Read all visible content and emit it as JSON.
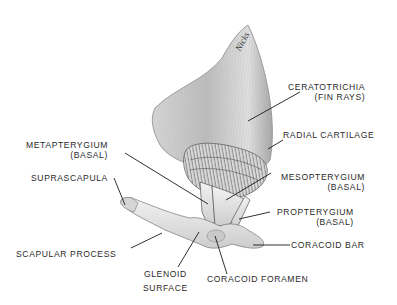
{
  "diagram": {
    "signature": "Nicks",
    "labels": [
      {
        "id": "ceratotrichia",
        "line1": "CERATOTRICHIA",
        "line2": "(FIN RAYS)"
      },
      {
        "id": "radial-cartilage",
        "line1": "RADIAL CARTILAGE"
      },
      {
        "id": "metapterygium",
        "line1": "METAPTERYGIUM",
        "line2": "(BASAL)"
      },
      {
        "id": "mesopterygium",
        "line1": "MESOPTERYGIUM",
        "line2": "(BASAL)"
      },
      {
        "id": "suprascapula",
        "line1": "SUPRASCAPULA"
      },
      {
        "id": "propterygium",
        "line1": "PROPTERYGIUM",
        "line2": "(BASAL)"
      },
      {
        "id": "scapular-process",
        "line1": "SCAPULAR PROCESS"
      },
      {
        "id": "coracoid-bar",
        "line1": "CORACOID BAR"
      },
      {
        "id": "glenoid-surface",
        "line1": "GLENOID",
        "line2": "SURFACE"
      },
      {
        "id": "coracoid-foramen",
        "line1": "CORACOID FORAMEN"
      }
    ]
  },
  "colors": {
    "background": "#ffffff",
    "text": "#2a2a2a",
    "leader": "#1a1a1a",
    "fin_fill": "#cfcfcf",
    "fin_shade": "#9a9a9a",
    "cartilage_fill": "#e6e6e6"
  }
}
